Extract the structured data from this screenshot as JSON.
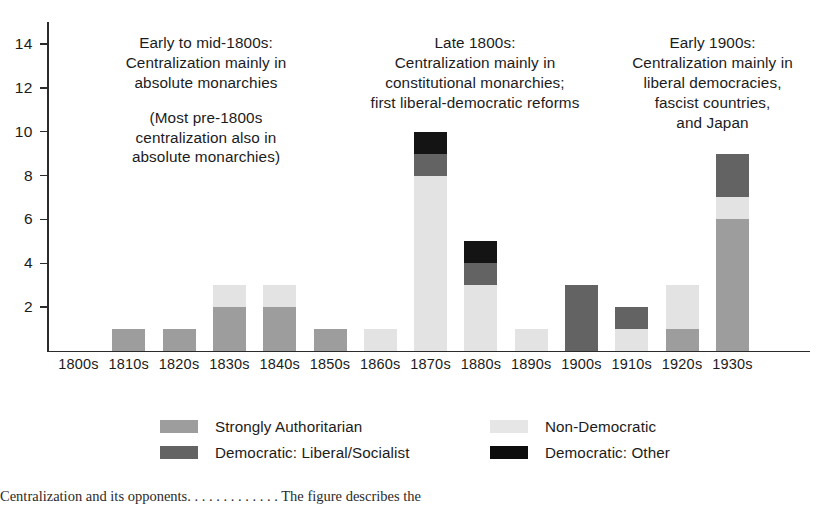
{
  "chart_data": {
    "type": "bar",
    "title": "",
    "xlabel": "",
    "ylabel": "",
    "stacked": true,
    "grid": false,
    "legend_position": "bottom",
    "ylim": [
      0,
      15
    ],
    "yticks": [
      2,
      4,
      6,
      8,
      10,
      12,
      14
    ],
    "ytick_labels": [
      "2",
      "4",
      "6",
      "8",
      "10",
      "12",
      "14"
    ],
    "categories": [
      "1800s",
      "1810s",
      "1820s",
      "1830s",
      "1840s",
      "1850s",
      "1860s",
      "1870s",
      "1880s",
      "1890s",
      "1900s",
      "1910s",
      "1920s",
      "1930s"
    ],
    "series": [
      {
        "name": "Strongly Authoritarian",
        "key": "auth",
        "color": "#9d9d9d",
        "values": [
          0,
          1,
          1,
          2,
          2,
          1,
          0,
          0,
          0,
          0,
          0,
          0,
          1,
          6
        ]
      },
      {
        "name": "Non-Democratic",
        "key": "nondem",
        "color": "#e3e3e3",
        "values": [
          0,
          0,
          0,
          1,
          1,
          0,
          1,
          8,
          3,
          1,
          0,
          1,
          2,
          1
        ]
      },
      {
        "name": "Democratic: Liberal/Socialist",
        "key": "libsoc",
        "color": "#636363",
        "values": [
          0,
          0,
          0,
          0,
          0,
          0,
          0,
          1,
          1,
          0,
          3,
          1,
          0,
          2
        ]
      },
      {
        "name": "Democratic: Other",
        "key": "other",
        "color": "#141414",
        "values": [
          0,
          0,
          0,
          0,
          0,
          0,
          0,
          1,
          1,
          0,
          0,
          0,
          0,
          0
        ]
      }
    ],
    "totals": [
      0,
      1,
      1,
      3,
      3,
      1,
      1,
      10,
      5,
      1,
      3,
      2,
      3,
      9
    ],
    "annotations": [
      {
        "id": "early-to-mid-1800s",
        "lines": [
          "Early to mid-1800s:",
          "Centralization mainly in",
          "absolute monarchies"
        ],
        "lines2": [
          "(Most pre-1800s",
          "centralization also in",
          "absolute monarchies)"
        ]
      },
      {
        "id": "late-1800s",
        "lines": [
          "Late 1800s:",
          "Centralization mainly in",
          "constitutional monarchies;",
          "first liberal-democratic reforms"
        ]
      },
      {
        "id": "early-1900s",
        "lines": [
          "Early 1900s:",
          "Centralization mainly in",
          "liberal democracies,",
          "fascist countries,",
          "and Japan"
        ]
      }
    ]
  },
  "legend": {
    "items": [
      {
        "label": "Strongly Authoritarian",
        "swatch": "auth"
      },
      {
        "label": "Non-Democratic",
        "swatch": "nondem"
      },
      {
        "label": "Democratic: Liberal/Socialist",
        "swatch": "libsoc"
      },
      {
        "label": "Democratic: Other",
        "swatch": "other"
      }
    ]
  },
  "page_text": {
    "sliver": "Centralization and its opponents. . . . . . . . . . . . . The figure describes the"
  }
}
